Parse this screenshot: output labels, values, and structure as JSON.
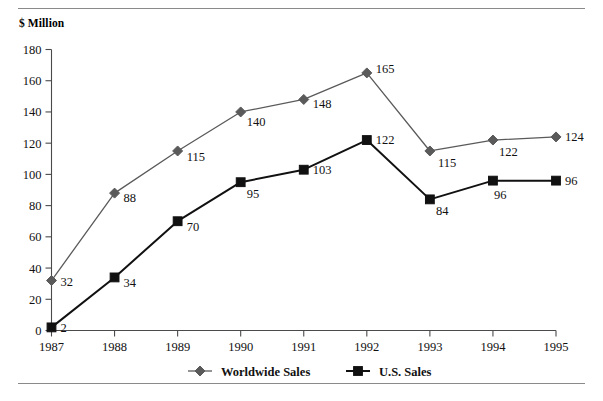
{
  "chart_data": {
    "type": "line",
    "title": "",
    "ylabel": "$ Million",
    "xlabel": "",
    "categories": [
      "1987",
      "1988",
      "1989",
      "1990",
      "1991",
      "1992",
      "1993",
      "1994",
      "1995"
    ],
    "ylim": [
      0,
      180
    ],
    "ytick_labels": [
      "0",
      "20",
      "40",
      "60",
      "80",
      "100",
      "120",
      "140",
      "160",
      "180"
    ],
    "ytick_values": [
      0,
      20,
      40,
      60,
      80,
      100,
      120,
      140,
      160,
      180
    ],
    "grid": false,
    "legend_position": "bottom-center",
    "series": [
      {
        "name": "Worldwide Sales",
        "marker": "diamond",
        "color": "#5a5a5a",
        "values": [
          32,
          88,
          115,
          140,
          148,
          165,
          115,
          122,
          124
        ],
        "data_labels": [
          "32",
          "88",
          "115",
          "140",
          "148",
          "165",
          "115",
          "122",
          "124"
        ]
      },
      {
        "name": "U.S. Sales",
        "marker": "square",
        "color": "#111111",
        "values": [
          2,
          34,
          70,
          95,
          103,
          122,
          84,
          96,
          96
        ],
        "data_labels": [
          "2",
          "34",
          "70",
          "95",
          "103",
          "122",
          "84",
          "96",
          "96"
        ]
      }
    ]
  },
  "legend": {
    "items": [
      {
        "label": "Worldwide Sales",
        "marker": "diamond",
        "color": "#5a5a5a"
      },
      {
        "label": "U.S. Sales",
        "marker": "square",
        "color": "#111111"
      }
    ]
  },
  "axis": {
    "y_title": "$ Million"
  }
}
